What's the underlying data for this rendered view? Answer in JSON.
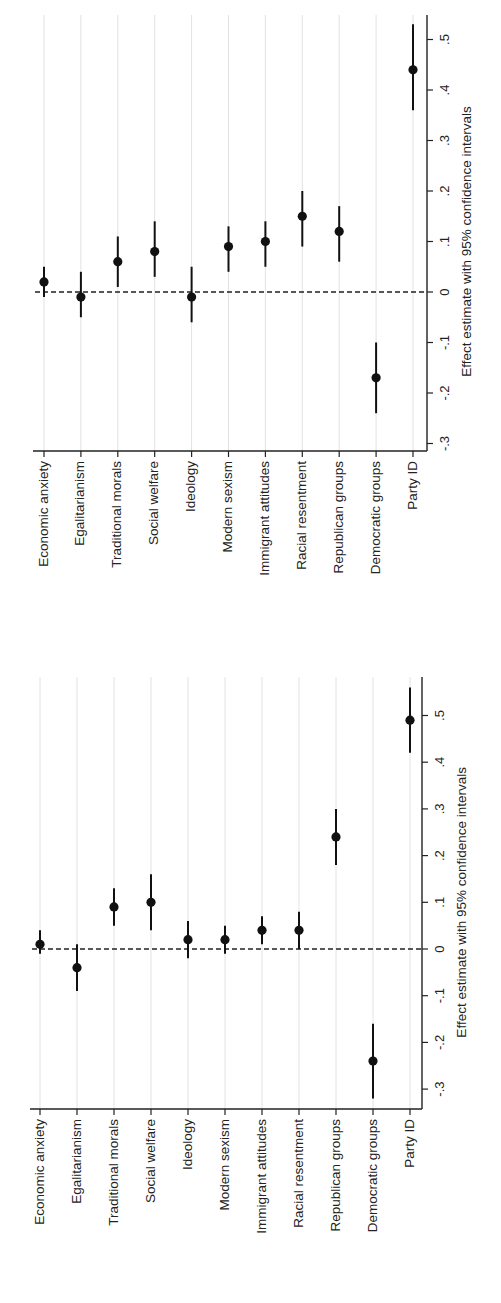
{
  "chart_data": [
    {
      "type": "scatter",
      "subtype": "coefficient-plot-with-error-bars",
      "orientation": "rotated 90deg (categories along horizontal, values along vertical, text rotated)",
      "title": "",
      "xlabel": "",
      "ylabel": "Effect estimate with 95% confidence intervals",
      "ylim": [
        -0.3,
        0.5
      ],
      "yticks": [
        -0.3,
        -0.2,
        -0.1,
        0,
        0.1,
        0.2,
        0.3,
        0.4,
        0.5
      ],
      "ytick_labels": [
        "-.3",
        "-.2",
        "-.1",
        "0",
        ".1",
        ".2",
        ".3",
        ".4",
        ".5"
      ],
      "reference_line": {
        "value": 0,
        "style": "dashed"
      },
      "grid": true,
      "legend": null,
      "categories": [
        "Economic anxiety",
        "Egalitarianism",
        "Traditional morals",
        "Social welfare",
        "Ideology",
        "Modern sexism",
        "Immigrant attitudes",
        "Racial resentment",
        "Republican groups",
        "Democratic groups",
        "Party ID"
      ],
      "series": [
        {
          "name": "Effect estimate",
          "values": [
            0.02,
            -0.01,
            0.06,
            0.08,
            -0.01,
            0.09,
            0.1,
            0.15,
            0.12,
            -0.17,
            0.44
          ],
          "ci_low": [
            -0.01,
            -0.05,
            0.01,
            0.03,
            -0.06,
            0.04,
            0.05,
            0.09,
            0.06,
            -0.24,
            0.36
          ],
          "ci_high": [
            0.05,
            0.04,
            0.11,
            0.14,
            0.05,
            0.13,
            0.14,
            0.2,
            0.17,
            -0.1,
            0.53
          ]
        }
      ],
      "layout": {
        "value_axis_x": 427,
        "zero_y": 292,
        "px_per_unit": 505,
        "cat_axis_y": 451,
        "cat_start_x": 44,
        "cat_step": 36.9,
        "plot_left": 33,
        "plot_top": 15,
        "tick_label_x": 446,
        "axis_title_x": 467
      }
    },
    {
      "type": "scatter",
      "subtype": "coefficient-plot-with-error-bars",
      "orientation": "rotated 90deg (categories along horizontal, values along vertical, text rotated)",
      "title": "",
      "xlabel": "",
      "ylabel": "Effect estimate with 95% confidence intervals",
      "ylim": [
        -0.3,
        0.5
      ],
      "yticks": [
        -0.3,
        -0.2,
        -0.1,
        0,
        0.1,
        0.2,
        0.3,
        0.4,
        0.5
      ],
      "ytick_labels": [
        "-.3",
        "-.2",
        "-.1",
        "0",
        ".1",
        ".2",
        ".3",
        ".4",
        ".5"
      ],
      "reference_line": {
        "value": 0,
        "style": "dashed"
      },
      "grid": true,
      "legend": null,
      "categories": [
        "Economic anxiety",
        "Egalitarianism",
        "Traditional morals",
        "Social welfare",
        "Ideology",
        "Modern sexism",
        "Immigrant attitudes",
        "Racial resentment",
        "Republican groups",
        "Democratic groups",
        "Party ID"
      ],
      "series": [
        {
          "name": "Effect estimate",
          "values": [
            0.01,
            -0.04,
            0.09,
            0.1,
            0.02,
            0.02,
            0.04,
            0.04,
            0.24,
            -0.24,
            0.49
          ],
          "ci_low": [
            -0.01,
            -0.09,
            0.05,
            0.04,
            -0.02,
            -0.01,
            0.01,
            0.0,
            0.18,
            -0.32,
            0.42
          ],
          "ci_high": [
            0.04,
            0.01,
            0.13,
            0.16,
            0.06,
            0.05,
            0.07,
            0.08,
            0.3,
            -0.16,
            0.56
          ]
        }
      ],
      "layout": {
        "value_axis_x": 422,
        "zero_y": 949,
        "px_per_unit": 467,
        "cat_axis_y": 1109,
        "cat_start_x": 40,
        "cat_step": 37,
        "plot_left": 30,
        "plot_top": 677,
        "tick_label_x": 441,
        "axis_title_x": 462
      }
    }
  ],
  "colors": {
    "marker": "#111111",
    "axis": "#222222",
    "grid": "#e2e2e2",
    "text": "#222222",
    "background": "#ffffff"
  }
}
